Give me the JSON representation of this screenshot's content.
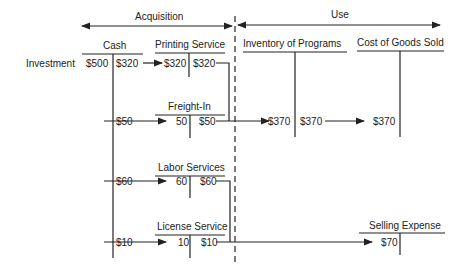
{
  "sections": {
    "acquisition": "Acquisition",
    "use": "Use"
  },
  "accounts": {
    "cash": {
      "title": "Cash",
      "debit": "$500",
      "credit": "$320"
    },
    "printing": {
      "title": "Printing Service",
      "debit": "$320",
      "credit": "$320"
    },
    "inventory": {
      "title": "Inventory of Programs",
      "debit": "$370",
      "credit": "$370"
    },
    "cogs": {
      "title": "Cost of Goods Sold",
      "debit": "$370"
    },
    "freight": {
      "title": "Freight-In",
      "source": "$50",
      "debit": "50",
      "credit": "$50"
    },
    "labor": {
      "title": "Labor Services",
      "source": "$60",
      "debit": "60",
      "credit": "$60"
    },
    "license": {
      "title": "License Service",
      "source": "$10",
      "debit": "10",
      "credit": "$10"
    },
    "selling": {
      "title": "Selling Expense",
      "debit": "$70"
    }
  },
  "labels": {
    "investment": "Investment"
  }
}
